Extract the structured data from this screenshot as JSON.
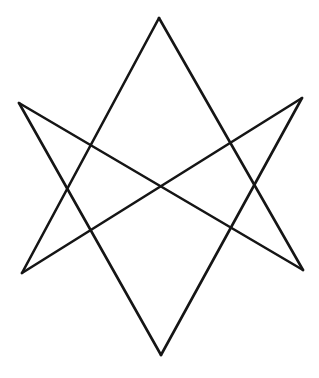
{
  "figure": {
    "background": "#ffffff",
    "stroke_color": "#151515",
    "stroke_width": 2.6,
    "vertices": {
      "top": [
        159,
        18
      ],
      "upper_left": [
        19,
        103
      ],
      "upper_right": [
        302,
        98
      ],
      "lower_left": [
        22,
        273
      ],
      "lower_right": [
        303,
        270
      ],
      "bottom": [
        161,
        355
      ]
    },
    "segments": [
      {
        "from": "top",
        "to": "lower_right"
      },
      {
        "from": "top",
        "to": "lower_left"
      },
      {
        "from": "upper_left",
        "to": "lower_right"
      },
      {
        "from": "upper_right",
        "to": "lower_left"
      },
      {
        "from": "upper_left",
        "to": "bottom"
      },
      {
        "from": "upper_right",
        "to": "bottom"
      }
    ]
  }
}
